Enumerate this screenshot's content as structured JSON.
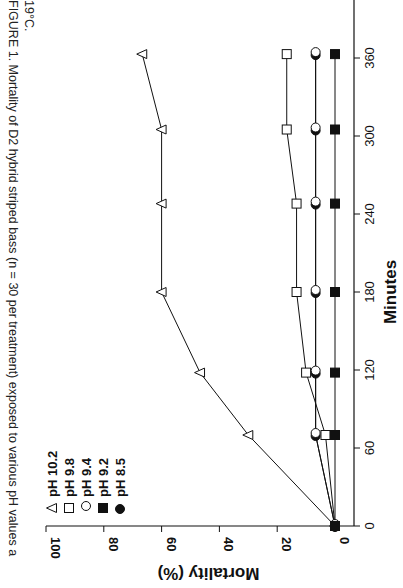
{
  "caption": {
    "line1": "FIGURE 1. Mortality of D2 hybrid striped bass (n = 30 per treatment) exposed to various pH values a",
    "line2": "19°C."
  },
  "chart_data": {
    "type": "line",
    "xlabel": "Minutes",
    "ylabel": "Mortality (%)",
    "orientation": "rotated 90° clockwise on page",
    "x": [
      0,
      70,
      118,
      180,
      248,
      305,
      363
    ],
    "xticks": [
      0,
      60,
      120,
      180,
      240,
      300,
      360
    ],
    "yticks": [
      0,
      20,
      40,
      60,
      80,
      100
    ],
    "xlim": [
      0,
      390
    ],
    "ylim": [
      0,
      100
    ],
    "grid": false,
    "legend_position": "upper left",
    "series": [
      {
        "name": "pH 10.2",
        "marker": "open-triangle",
        "values": [
          0,
          30,
          46.7,
          60,
          60,
          60,
          66.7
        ]
      },
      {
        "name": "pH 9.8",
        "marker": "open-square",
        "values": [
          0,
          3.3,
          10,
          13.3,
          13.3,
          16.7,
          16.7
        ]
      },
      {
        "name": "pH 9.4",
        "marker": "open-circle",
        "values": [
          0,
          6.7,
          6.7,
          6.7,
          6.7,
          6.7,
          6.7
        ]
      },
      {
        "name": "pH 9.2",
        "marker": "filled-square",
        "values": [
          0,
          0,
          0,
          0,
          0,
          0,
          0
        ]
      },
      {
        "name": "pH 8.5",
        "marker": "filled-circle",
        "values": [
          0,
          6.7,
          6.7,
          6.7,
          6.7,
          6.7,
          6.7
        ]
      }
    ]
  },
  "colors": {
    "ink": "#111111",
    "background": "#ffffff"
  }
}
